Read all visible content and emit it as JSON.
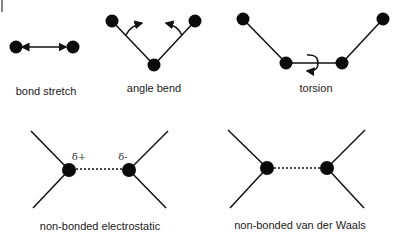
{
  "diagram": {
    "colors": {
      "atom": "#0a0a0a",
      "bond": "#111111",
      "text": "#222222",
      "background": "#ffffff"
    },
    "panels": [
      {
        "id": "bond-stretch",
        "label": "bond stretch"
      },
      {
        "id": "angle-bend",
        "label": "angle bend"
      },
      {
        "id": "torsion",
        "label": "torsion"
      },
      {
        "id": "electrostatic",
        "label": "non-bonded electrostatic",
        "charges": {
          "left": "δ+",
          "right": "δ-"
        }
      },
      {
        "id": "vdw",
        "label": "non-bonded van der Waals"
      }
    ]
  }
}
